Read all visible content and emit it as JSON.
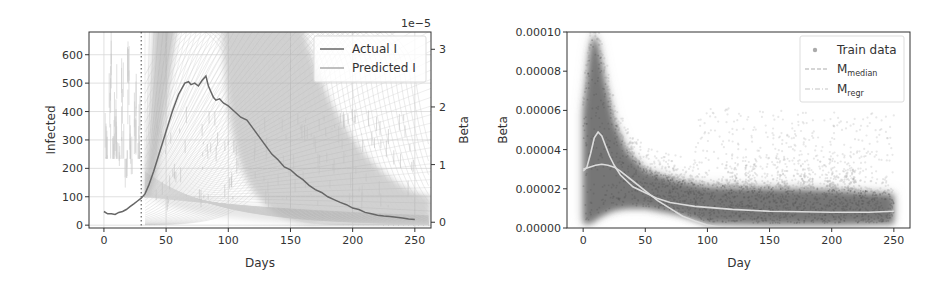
{
  "chart_data": [
    {
      "type": "line",
      "title": "",
      "xlabel": "Days",
      "ylabel": "Infected",
      "ylabel_right": "Beta",
      "right_axis_offset_text": "1e−5",
      "xlim": [
        -12,
        263
      ],
      "ylim": [
        -10,
        680
      ],
      "ylim_right": [
        -0.1,
        3.3
      ],
      "xticks": [
        0,
        50,
        100,
        150,
        200,
        250
      ],
      "yticks": [
        0,
        100,
        200,
        300,
        400,
        500,
        600
      ],
      "yticks_right": [
        0,
        1,
        2,
        3
      ],
      "grid": true,
      "legend_position": "upper right",
      "vline_dotted_x": 30,
      "legend": [
        {
          "label": "Actual I",
          "style": "solid-dark"
        },
        {
          "label": "Predicted I",
          "style": "solid-light"
        }
      ],
      "series": [
        {
          "name": "Actual I",
          "x": [
            0,
            3,
            6,
            9,
            12,
            15,
            18,
            21,
            24,
            27,
            30,
            33,
            36,
            40,
            45,
            50,
            55,
            60,
            65,
            68,
            70,
            73,
            76,
            79,
            82,
            84,
            86,
            88,
            90,
            93,
            96,
            100,
            105,
            110,
            115,
            120,
            125,
            130,
            135,
            140,
            145,
            150,
            155,
            160,
            165,
            170,
            175,
            180,
            185,
            190,
            195,
            200,
            205,
            210,
            215,
            220,
            225,
            230,
            235,
            240,
            245,
            250
          ],
          "values": [
            48,
            40,
            40,
            38,
            45,
            48,
            55,
            65,
            75,
            85,
            95,
            110,
            140,
            190,
            260,
            330,
            400,
            460,
            500,
            505,
            495,
            500,
            490,
            510,
            525,
            490,
            470,
            450,
            440,
            445,
            430,
            420,
            400,
            380,
            370,
            340,
            310,
            280,
            250,
            230,
            205,
            195,
            175,
            160,
            140,
            125,
            115,
            100,
            90,
            80,
            72,
            60,
            55,
            45,
            40,
            35,
            32,
            30,
            28,
            25,
            22,
            20
          ]
        },
        {
          "name": "Beta (right axis, light scatter)",
          "x": [
            2,
            5,
            8,
            10,
            12,
            15,
            18,
            20,
            22,
            25,
            28
          ],
          "values_e5": [
            1.8,
            3.2,
            2.2,
            2.6,
            1.5,
            2.7,
            1.2,
            2.9,
            1.6,
            2.4,
            2.0
          ]
        }
      ],
      "predicted_fan": {
        "description": "Many predicted trajectories fanning out from day ~33, I~100; dense band rising steeply and decaying around day 95-150",
        "origin": [
          33,
          100
        ],
        "band_peak_left_x": [
          38,
          55
        ],
        "band_right_decay_x": [
          95,
          150
        ]
      }
    },
    {
      "type": "scatter",
      "title": "",
      "xlabel": "Day",
      "ylabel": "Beta",
      "xlim": [
        -13,
        263
      ],
      "ylim": [
        0,
        0.0001
      ],
      "xticks": [
        0,
        50,
        100,
        150,
        200,
        250
      ],
      "yticks": [
        0.0,
        2e-05,
        4e-05,
        6e-05,
        8e-05,
        0.0001
      ],
      "ytick_labels": [
        "0.00000",
        "0.00002",
        "0.00004",
        "0.00006",
        "0.00008",
        "0.00010"
      ],
      "grid": false,
      "legend_position": "upper right",
      "legend": [
        {
          "label": "Train data",
          "marker": "dot"
        },
        {
          "label": "M",
          "subscript": "median",
          "style": "dashed-light"
        },
        {
          "label": "M",
          "subscript": "regr",
          "style": "dashdot-light"
        }
      ],
      "series": [
        {
          "name": "M_median",
          "x": [
            0,
            3,
            6,
            9,
            12,
            15,
            18,
            21,
            25,
            30,
            35,
            40,
            50,
            60,
            70,
            80,
            90,
            100,
            120,
            150,
            200,
            230,
            250
          ],
          "values": [
            2.9e-05,
            3.1e-05,
            3.8e-05,
            4.6e-05,
            4.9e-05,
            4.7e-05,
            4.2e-05,
            3.7e-05,
            3.2e-05,
            2.7e-05,
            2.4e-05,
            2.1e-05,
            1.8e-05,
            1.5e-05,
            1.3e-05,
            1.2e-05,
            1.1e-05,
            1.05e-05,
            9.5e-06,
            8.5e-06,
            8e-06,
            8e-06,
            8.5e-06
          ]
        },
        {
          "name": "M_regr",
          "x": [
            0,
            5,
            10,
            15,
            20,
            25,
            30,
            40,
            50,
            60,
            70,
            80,
            90,
            100,
            110,
            115
          ],
          "values": [
            3e-05,
            3.1e-05,
            3.2e-05,
            3.25e-05,
            3.2e-05,
            3.1e-05,
            2.9e-05,
            2.4e-05,
            1.9e-05,
            1.4e-05,
            1e-05,
            6e-06,
            3.5e-06,
            1.5e-06,
            5e-07,
            0.0
          ]
        },
        {
          "name": "Train data envelope",
          "x": [
            0,
            5,
            8,
            12,
            18,
            25,
            35,
            50,
            75,
            100,
            150,
            200,
            250
          ],
          "upper": [
            6e-05,
            9e-05,
            0.0001,
            9.5e-05,
            7.5e-05,
            5.5e-05,
            4e-05,
            3e-05,
            2.5e-05,
            2.2e-05,
            2.1e-05,
            2e-05,
            1.8e-05
          ],
          "lower": [
            3e-06,
            3e-06,
            4e-06,
            6e-06,
            8e-06,
            1e-05,
            1.1e-05,
            1.1e-05,
            8e-06,
            3e-06,
            2.5e-06,
            2.5e-06,
            3e-06
          ]
        }
      ]
    }
  ],
  "colors": {
    "axis": "#333333",
    "grid": "#d8d8d8",
    "actual_line": "#666666",
    "predicted_band": "#9a9a9a",
    "scatter_dark": "#5a5a5a",
    "scatter_light": "#bdbdbd",
    "model_line": "#dcdcdc"
  }
}
